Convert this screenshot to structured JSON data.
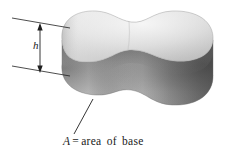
{
  "figure": {
    "type": "geometry-diagram",
    "background_color": "#ffffff",
    "line_color": "#1a1a1a"
  },
  "solid": {
    "name": "peanut-shaped-prism",
    "top_face": {
      "name": "top-surface",
      "fill_light": "#e9e9e9",
      "fill_mid": "#d2d2d2",
      "fill_dark": "#b4b4b4"
    },
    "lateral_face": {
      "name": "lateral-surface",
      "fill_light": "#b0b0b0",
      "fill_mid": "#8f8f8f",
      "fill_dark": "#565656"
    },
    "left_lobe_edge_shade": "#7e7e7e",
    "right_lobe_edge_shade": "#4f4f4f"
  },
  "height_dimension": {
    "name": "height-dimension",
    "label": "h",
    "label_style": "italic",
    "arrow_top_y": 24,
    "arrow_bottom_y": 72,
    "arrow_x": 40,
    "extension_line_top": {
      "x1": 12,
      "y1": 18,
      "x2": 70,
      "y2": 28
    },
    "extension_line_bottom": {
      "x1": 12,
      "y1": 66,
      "x2": 70,
      "y2": 76
    }
  },
  "base_callout": {
    "name": "base-area-callout",
    "symbol": "A",
    "equals": "=",
    "text": "area of base",
    "full_text": "A = area of base",
    "leader_line": {
      "x1": 74,
      "y1": 134,
      "x2": 93,
      "y2": 99
    }
  }
}
